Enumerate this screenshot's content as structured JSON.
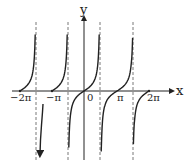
{
  "chart_data": {
    "type": "line",
    "title": "",
    "function_description": "tangent-type periodic graph with period pi, zeros at multiples of pi, vertical asymptotes between",
    "xlabel": "x",
    "ylabel": "y",
    "x_tick_labels": [
      "−2π",
      "−π",
      "0",
      "π",
      "2π"
    ],
    "x_tick_values": [
      -6.283,
      -3.142,
      0,
      3.142,
      6.283
    ],
    "asymptotes_x": [
      -4.9,
      -1.75,
      1.4,
      4.55
    ],
    "grid": false,
    "legend": null,
    "pixel_map": {
      "axis_y": 91,
      "yaxis_x": 84,
      "ticks_px": [
        20,
        52,
        84,
        117,
        149
      ],
      "asymptotes_px": [
        36,
        68,
        100,
        133
      ],
      "top": 26,
      "bottom": 154
    }
  },
  "labels": {
    "x_axis": "x",
    "y_axis": "y",
    "ticks": [
      "−2π",
      "−π",
      "0",
      "π",
      "2π"
    ]
  }
}
